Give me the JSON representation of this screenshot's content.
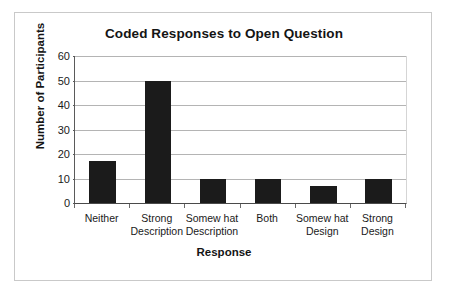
{
  "chart_data": {
    "type": "bar",
    "title": "Coded Responses to Open Question",
    "xlabel": "Response",
    "ylabel": "Number of Participants",
    "categories": [
      "Neither",
      "Strong Description",
      "Somew hat Description",
      "Both",
      "Somew hat Design",
      "Strong Design"
    ],
    "category_lines": [
      [
        "Neither"
      ],
      [
        "Strong",
        "Description"
      ],
      [
        "Somew hat",
        "Description"
      ],
      [
        "Both"
      ],
      [
        "Somew hat",
        "Design"
      ],
      [
        "Strong",
        "Design"
      ]
    ],
    "values": [
      17,
      50,
      10,
      10,
      7,
      10
    ],
    "ylim": [
      0,
      60
    ],
    "yticks": [
      0,
      10,
      20,
      30,
      40,
      50,
      60
    ],
    "ytick_labels": [
      "0",
      "10",
      "20",
      "30",
      "40",
      "50",
      "60"
    ],
    "grid": true,
    "legend": false,
    "bar_color": "#1b1b1b",
    "gridline_color": "#b4b4b4",
    "frame_color": "#c9c9c9"
  }
}
